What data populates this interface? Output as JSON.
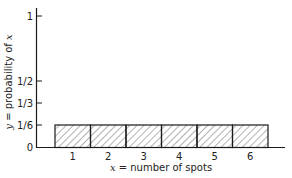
{
  "chart_data": {
    "type": "bar",
    "title": "",
    "xlabel": "x = number of spots",
    "ylabel": "y = probability of x",
    "categories": [
      "1",
      "2",
      "3",
      "4",
      "5",
      "6"
    ],
    "values": [
      0.1667,
      0.1667,
      0.1667,
      0.1667,
      0.1667,
      0.1667
    ],
    "values_fraction": [
      "1/6",
      "1/6",
      "1/6",
      "1/6",
      "1/6",
      "1/6"
    ],
    "ylim": [
      0,
      1
    ],
    "y_ticks": [
      {
        "value": 0,
        "label": "0"
      },
      {
        "value": 0.1667,
        "label": "1/6"
      },
      {
        "value": 0.3333,
        "label": "1/3"
      },
      {
        "value": 0.5,
        "label": "1/2"
      },
      {
        "value": 1,
        "label": "1"
      }
    ],
    "bar_fill": "diagonal-hatch",
    "grid": false,
    "legend": null
  },
  "labels": {
    "x_axis_var": "x",
    "x_axis_rest": " = number of spots",
    "y_axis_var_y": "y",
    "y_axis_mid": " = probability of ",
    "y_axis_var_x": "x"
  },
  "colors": {
    "stroke": "#1a1a1a",
    "hatch": "#555555",
    "background": "#ffffff"
  }
}
